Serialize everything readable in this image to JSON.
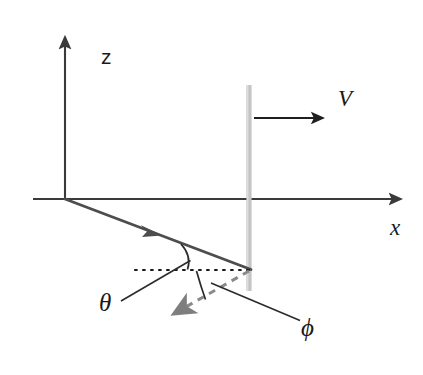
{
  "figure": {
    "background_color": "#ffffff",
    "width": 423,
    "height": 375
  },
  "colors": {
    "axis": "#3a3a3a",
    "ray_incident": "#4a4a4a",
    "ray_scattered": "#8a8a8a",
    "boundary": "#c9c9c9",
    "arc": "#2b2b2b",
    "dotted": "#1a1a1a",
    "text": "#1a1a1a"
  },
  "labels": {
    "z_axis": "z",
    "x_axis": "x",
    "velocity": "V",
    "theta": "θ",
    "phi": "ϕ"
  },
  "elements": {
    "z_axis": {
      "name": "vertical-axis",
      "from": [
        65,
        199
      ],
      "to": [
        65,
        33
      ],
      "arrow": "up"
    },
    "x_axis": {
      "name": "horizontal-axis",
      "from": [
        33,
        199
      ],
      "to": [
        405,
        199
      ],
      "arrow": "right"
    },
    "boundary": {
      "name": "moving-boundary",
      "x": 249,
      "from_y": 85,
      "to_y": 291,
      "thickness": 5
    },
    "velocity_arrow": {
      "name": "velocity-vector",
      "from": [
        254,
        118
      ],
      "to": [
        328,
        118
      ],
      "arrow": "right"
    },
    "incident_ray": {
      "name": "incident-ray",
      "from": [
        65,
        199
      ],
      "to": [
        251,
        269
      ],
      "midpoint_arrow": [
        152,
        231
      ]
    },
    "scattered_ray": {
      "name": "scattered-ray-dashed",
      "from": [
        249,
        271
      ],
      "to": [
        168,
        317
      ],
      "arrow": "down-left",
      "style": "dashed"
    },
    "dotted_reference": {
      "name": "horizontal-reference-dotted",
      "from": [
        135,
        270
      ],
      "to": [
        250,
        270
      ]
    },
    "theta_arc": {
      "name": "theta-angle-arc",
      "from": [
        181,
        244
      ],
      "to": [
        188,
        269
      ]
    },
    "phi_arc": {
      "name": "phi-angle-arc",
      "from": [
        196,
        271
      ],
      "to": [
        205,
        299
      ]
    },
    "theta_leader": {
      "name": "theta-leader-line",
      "from": [
        121,
        301
      ],
      "to": [
        190,
        261
      ]
    },
    "phi_leader": {
      "name": "phi-leader-line",
      "from": [
        211,
        283
      ],
      "to": [
        300,
        320
      ]
    }
  },
  "label_positions": {
    "z": [
      101,
      64
    ],
    "x": [
      391,
      234
    ],
    "V": [
      339,
      105
    ],
    "theta": [
      99,
      310
    ],
    "phi": [
      302,
      334
    ]
  }
}
